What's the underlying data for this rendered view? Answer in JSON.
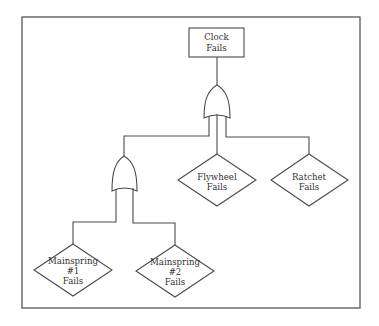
{
  "diagram": {
    "type": "fault-tree",
    "top_event": {
      "id": "clock",
      "shape": "rectangle",
      "lines": [
        "Clock",
        "Fails"
      ]
    },
    "gates": [
      {
        "id": "or-gate-top",
        "type": "OR",
        "output": "clock",
        "inputs": [
          "or-gate-mainspring",
          "flywheel",
          "ratchet"
        ]
      },
      {
        "id": "or-gate-mainspring",
        "type": "OR",
        "inputs": [
          "mainspring1",
          "mainspring2"
        ]
      }
    ],
    "events": [
      {
        "id": "flywheel",
        "shape": "diamond",
        "lines": [
          "Flywheel",
          "Fails"
        ]
      },
      {
        "id": "ratchet",
        "shape": "diamond",
        "lines": [
          "Ratchet",
          "Fails"
        ]
      },
      {
        "id": "mainspring1",
        "shape": "diamond",
        "lines": [
          "Mainspring",
          "#1",
          "Fails"
        ]
      },
      {
        "id": "mainspring2",
        "shape": "diamond",
        "lines": [
          "Mainspring",
          "#2",
          "Fails"
        ]
      }
    ]
  },
  "labels": {
    "clock": {
      "l1": "Clock",
      "l2": "Fails"
    },
    "flywheel": {
      "l1": "Flywheel",
      "l2": "Fails"
    },
    "ratchet": {
      "l1": "Ratchet",
      "l2": "Fails"
    },
    "mainspring1": {
      "l1": "Mainspring",
      "l2": "#1",
      "l3": "Fails"
    },
    "mainspring2": {
      "l1": "Mainspring",
      "l2": "#2",
      "l3": "Fails"
    }
  },
  "colors": {
    "line": "#4a4a4a",
    "text": "#333333",
    "background": "#ffffff"
  }
}
